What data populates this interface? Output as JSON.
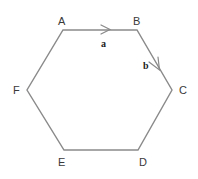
{
  "figure": {
    "background_color": "#ffffff",
    "stroke_color": "#8a8a8a",
    "label_color": "#3a3a3a",
    "vector_label_color": "#1c1c1c"
  },
  "hexagon": {
    "vertices": [
      {
        "name": "A",
        "label": "A",
        "x": 63,
        "y": 30,
        "label_x": 58,
        "label_y": 16
      },
      {
        "name": "B",
        "label": "B",
        "x": 137,
        "y": 30,
        "label_x": 133,
        "label_y": 16
      },
      {
        "name": "C",
        "label": "C",
        "x": 172,
        "y": 90,
        "label_x": 179,
        "label_y": 85
      },
      {
        "name": "D",
        "label": "D",
        "x": 138,
        "y": 150,
        "label_x": 139,
        "label_y": 157
      },
      {
        "name": "E",
        "label": "E",
        "x": 64,
        "y": 150,
        "label_x": 58,
        "label_y": 157
      },
      {
        "name": "F",
        "label": "F",
        "x": 27,
        "y": 90,
        "label_x": 13,
        "label_y": 85
      }
    ],
    "edges": [
      {
        "name": "edge-AB",
        "from": "A",
        "to": "B"
      },
      {
        "name": "edge-BC",
        "from": "B",
        "to": "C"
      },
      {
        "name": "edge-CD",
        "from": "C",
        "to": "D"
      },
      {
        "name": "edge-DE",
        "from": "D",
        "to": "E"
      },
      {
        "name": "edge-EF",
        "from": "E",
        "to": "F"
      },
      {
        "name": "edge-FA",
        "from": "F",
        "to": "A"
      }
    ]
  },
  "vectors": [
    {
      "name": "vector-a",
      "label": "a",
      "on_edge": "AB",
      "direction": "right",
      "label_x": 101,
      "label_y": 39,
      "arrow_tip_x": 110,
      "arrow_tip_y": 30
    },
    {
      "name": "vector-b",
      "label": "b",
      "on_edge": "BC",
      "direction": "down-right",
      "label_x": 143,
      "label_y": 61,
      "arrow_tip_x": 160,
      "arrow_tip_y": 70
    }
  ]
}
